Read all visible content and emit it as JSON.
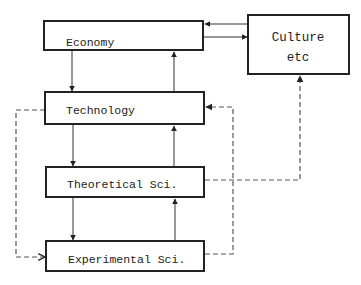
{
  "diagram": {
    "nodes": {
      "economy": {
        "label": "Economy"
      },
      "culture": {
        "line1": "Culture",
        "line2": "etc"
      },
      "technology": {
        "label": "Technology"
      },
      "theoretical": {
        "label": "Theoretical Sci."
      },
      "experimental": {
        "label": "Experimental Sci."
      }
    },
    "edges": [
      {
        "from": "culture",
        "to": "economy",
        "style": "solid"
      },
      {
        "from": "economy",
        "to": "culture",
        "style": "solid"
      },
      {
        "from": "economy",
        "to": "technology",
        "style": "solid"
      },
      {
        "from": "technology",
        "to": "economy",
        "style": "solid"
      },
      {
        "from": "technology",
        "to": "theoretical",
        "style": "solid"
      },
      {
        "from": "theoretical",
        "to": "technology",
        "style": "solid"
      },
      {
        "from": "theoretical",
        "to": "experimental",
        "style": "solid"
      },
      {
        "from": "experimental",
        "to": "theoretical",
        "style": "solid"
      },
      {
        "from": "technology",
        "to": "experimental",
        "style": "dashed"
      },
      {
        "from": "experimental",
        "to": "technology",
        "style": "dashed"
      },
      {
        "from": "theoretical",
        "to": "culture",
        "style": "dashed"
      }
    ],
    "colors": {
      "box_stroke": "#222222",
      "line": "#333333",
      "dashed": "#555555",
      "background": "#ffffff"
    }
  }
}
